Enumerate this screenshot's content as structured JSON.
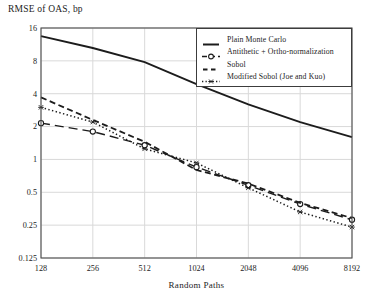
{
  "title": "RMSE of OAS, bp",
  "chart_data": {
    "type": "line",
    "title": "RMSE of OAS, bp",
    "xlabel": "Random Paths",
    "ylabel": "RMSE of OAS, bp",
    "x_scale": "log2",
    "y_scale": "log2",
    "xlim": [
      128,
      8192
    ],
    "ylim": [
      0.125,
      16
    ],
    "x_ticks": [
      128,
      256,
      512,
      1024,
      2048,
      4096,
      8192
    ],
    "x_tick_labels": [
      "128",
      "256",
      "512",
      "1024",
      "2048",
      "4096",
      "8192"
    ],
    "y_ticks": [
      16,
      8,
      4,
      2,
      1,
      0.5,
      0.25,
      0.125
    ],
    "y_tick_labels": [
      "16",
      "8",
      "4",
      "2",
      "1",
      "0.5",
      "0.25",
      "0.125"
    ],
    "grid": true,
    "legend_position": "top-right",
    "x": [
      128,
      256,
      512,
      1024,
      2048,
      4096,
      8192
    ],
    "series": [
      {
        "name": "Plain Monte Carlo",
        "style": "solid",
        "marker": "none",
        "values": [
          13.5,
          10.5,
          7.8,
          4.9,
          3.2,
          2.2,
          1.6
        ]
      },
      {
        "name": "Antithetic + Ortho-normalization",
        "style": "long-dash",
        "marker": "circle",
        "values": [
          2.15,
          1.8,
          1.35,
          0.85,
          0.58,
          0.39,
          0.28
        ]
      },
      {
        "name": "Sobol",
        "style": "dash",
        "marker": "none",
        "values": [
          3.7,
          2.3,
          1.45,
          0.8,
          0.6,
          0.4,
          0.29
        ]
      },
      {
        "name": "Modified Sobol (Joe and Kuo)",
        "style": "dotted",
        "marker": "star",
        "values": [
          3.0,
          2.2,
          1.25,
          0.93,
          0.55,
          0.33,
          0.24
        ]
      }
    ],
    "colors": {
      "line": "#1c1c1c",
      "grid": "#d9d9d9",
      "frame": "#4d4d4d",
      "background": "#ffffff"
    }
  }
}
